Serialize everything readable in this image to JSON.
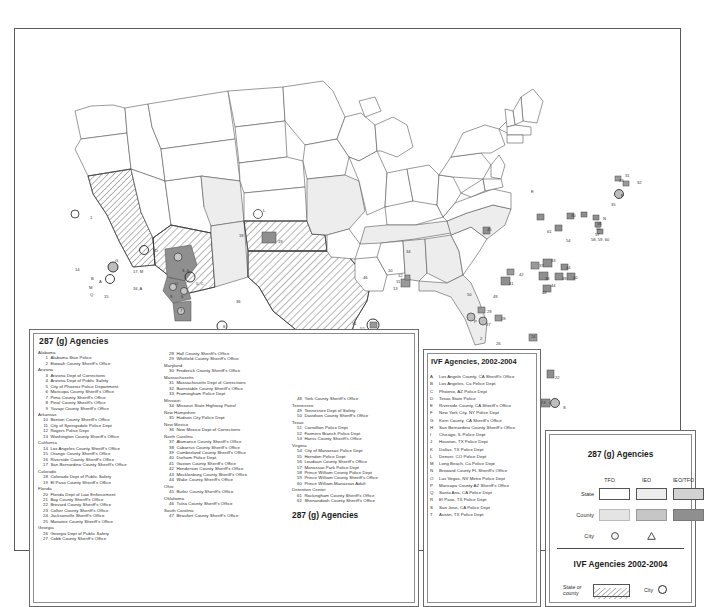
{
  "map": {
    "title": "287(g) and IVF Agencies United States Map",
    "region": "United States",
    "colors": {
      "state_tfo": "#ffffff",
      "state_ieo": "#ededed",
      "state_ieo_tfo": "#d2d2d2",
      "county_tfo": "#e4e4e4",
      "county_ieo": "#c6c6c6",
      "county_ieo_tfo": "#8f8f8f",
      "outline": "#555555",
      "hatch": "#6b6b6b"
    },
    "map_labels": [
      {
        "id": "1",
        "x": 73,
        "y": 189
      },
      {
        "id": "G",
        "x": 100,
        "y": 232
      },
      {
        "id": "17, M",
        "x": 118,
        "y": 243
      },
      {
        "id": "14",
        "x": 65,
        "y": 241
      },
      {
        "id": "B",
        "x": 76,
        "y": 250
      },
      {
        "id": "A",
        "x": 82,
        "y": 253
      },
      {
        "id": "M",
        "x": 75,
        "y": 259
      },
      {
        "id": "Q",
        "x": 76,
        "y": 266
      },
      {
        "id": "15",
        "x": 89,
        "y": 268
      },
      {
        "id": "16, A",
        "x": 118,
        "y": 260
      },
      {
        "id": "D",
        "x": 140,
        "y": 222
      },
      {
        "id": "3, 4",
        "x": 167,
        "y": 242
      },
      {
        "id": "O",
        "x": 160,
        "y": 255
      },
      {
        "id": "5, C",
        "x": 180,
        "y": 255
      },
      {
        "id": "9",
        "x": 155,
        "y": 268
      },
      {
        "id": "6",
        "x": 166,
        "y": 268
      },
      {
        "id": "7",
        "x": 165,
        "y": 282
      },
      {
        "id": "36",
        "x": 234,
        "y": 273
      },
      {
        "id": "18",
        "x": 237,
        "y": 207
      },
      {
        "id": "L",
        "x": 259,
        "y": 196
      },
      {
        "id": "19",
        "x": 268,
        "y": 213
      },
      {
        "id": "8",
        "x": 220,
        "y": 298
      },
      {
        "id": "46",
        "x": 349,
        "y": 249
      },
      {
        "id": "10",
        "x": 374,
        "y": 242
      },
      {
        "id": "12",
        "x": 383,
        "y": 247
      },
      {
        "id": "11",
        "x": 381,
        "y": 253
      },
      {
        "id": "13",
        "x": 378,
        "y": 260
      },
      {
        "id": "34",
        "x": 391,
        "y": 223
      },
      {
        "id": "51",
        "x": 338,
        "y": 295
      },
      {
        "id": "D",
        "x": 310,
        "y": 316
      },
      {
        "id": "52",
        "x": 345,
        "y": 300
      },
      {
        "id": "T",
        "x": 337,
        "y": 332
      },
      {
        "id": "53",
        "x": 366,
        "y": 341
      },
      {
        "id": "J",
        "x": 365,
        "y": 347
      },
      {
        "id": "45",
        "x": 485,
        "y": 203
      },
      {
        "id": "E",
        "x": 529,
        "y": 163
      },
      {
        "id": "N",
        "x": 596,
        "y": 190
      },
      {
        "id": "56",
        "x": 591,
        "y": 195
      },
      {
        "id": "55",
        "x": 590,
        "y": 200
      },
      {
        "id": "57",
        "x": 589,
        "y": 206
      },
      {
        "id": "58, 59, 60",
        "x": 589,
        "y": 211
      },
      {
        "id": "30",
        "x": 566,
        "y": 187
      },
      {
        "id": "61",
        "x": 541,
        "y": 203
      },
      {
        "id": "54",
        "x": 560,
        "y": 212
      },
      {
        "id": "37",
        "x": 535,
        "y": 237
      },
      {
        "id": "43",
        "x": 547,
        "y": 232
      },
      {
        "id": "44",
        "x": 562,
        "y": 239
      },
      {
        "id": "38",
        "x": 541,
        "y": 250
      },
      {
        "id": "39",
        "x": 558,
        "y": 250
      },
      {
        "id": "40",
        "x": 568,
        "y": 249
      },
      {
        "id": "42",
        "x": 516,
        "y": 246
      },
      {
        "id": "41",
        "x": 506,
        "y": 255
      },
      {
        "id": "44",
        "x": 547,
        "y": 257
      },
      {
        "id": "48",
        "x": 538,
        "y": 264
      },
      {
        "id": "29",
        "x": 484,
        "y": 283
      },
      {
        "id": "P",
        "x": 471,
        "y": 293
      },
      {
        "id": "28",
        "x": 497,
        "y": 290
      },
      {
        "id": "27",
        "x": 483,
        "y": 296
      },
      {
        "id": "26",
        "x": 493,
        "y": 315
      },
      {
        "id": "47",
        "x": 532,
        "y": 325
      },
      {
        "id": "21",
        "x": 465,
        "y": 333
      },
      {
        "id": "24",
        "x": 528,
        "y": 308
      },
      {
        "id": "20",
        "x": 524,
        "y": 344
      },
      {
        "id": "22",
        "x": 551,
        "y": 349
      },
      {
        "id": "25",
        "x": 518,
        "y": 362
      },
      {
        "id": "23",
        "x": 538,
        "y": 374
      },
      {
        "id": "S",
        "x": 556,
        "y": 377
      },
      {
        "id": "49",
        "x": 490,
        "y": 268
      },
      {
        "id": "50",
        "x": 463,
        "y": 266
      },
      {
        "id": "35",
        "x": 606,
        "y": 176
      },
      {
        "id": "F",
        "x": 613,
        "y": 167
      },
      {
        "id": "31",
        "x": 617,
        "y": 147
      },
      {
        "id": "33",
        "x": 612,
        "y": 152
      },
      {
        "id": "32",
        "x": 629,
        "y": 154
      },
      {
        "id": "2",
        "x": 476,
        "y": 310
      }
    ]
  },
  "panel_287g": {
    "title": "287 (g) Agencies",
    "footer": "287 (g) Agencies",
    "column1": [
      {
        "type": "state",
        "name": "Alabama"
      },
      {
        "type": "agency",
        "num": "1",
        "name": "Alabama Stae Police"
      },
      {
        "type": "agency",
        "num": "2",
        "name": "Etowah County Sheriff's Office"
      },
      {
        "type": "state",
        "name": "Arizona"
      },
      {
        "type": "agency",
        "num": "3",
        "name": "Arizona Dept of Corrections"
      },
      {
        "type": "agency",
        "num": "4",
        "name": "Arizona Dept of Public Safety"
      },
      {
        "type": "agency",
        "num": "5",
        "name": "City of Phoenix Police Department"
      },
      {
        "type": "agency",
        "num": "6",
        "name": "Maricopa County Sheriff's Office"
      },
      {
        "type": "agency",
        "num": "7",
        "name": "Pima County Sheriff's Office"
      },
      {
        "type": "agency",
        "num": "8",
        "name": "Pinal County Sheriff's Office"
      },
      {
        "type": "agency",
        "num": "9",
        "name": "Yavapi County Sheriff's Office"
      },
      {
        "type": "state",
        "name": "Arkansas"
      },
      {
        "type": "agency",
        "num": "10",
        "name": "Benton County Sheriff's Office"
      },
      {
        "type": "agency",
        "num": "11",
        "name": "City of Springsdale Police Dept"
      },
      {
        "type": "agency",
        "num": "12",
        "name": "Rogers Police Dept"
      },
      {
        "type": "agency",
        "num": "13",
        "name": "Washington County Sheriff's Office"
      },
      {
        "type": "state",
        "name": "California"
      },
      {
        "type": "agency",
        "num": "14",
        "name": "Los Angeles County Sheriff's Office"
      },
      {
        "type": "agency",
        "num": "15",
        "name": "Orange County Sheriff's Office"
      },
      {
        "type": "agency",
        "num": "16",
        "name": "Riverside County Sheriff's Office"
      },
      {
        "type": "agency",
        "num": "17",
        "name": "San Bernardino County Sheriff's Office"
      },
      {
        "type": "state",
        "name": "Colorado"
      },
      {
        "type": "agency",
        "num": "18",
        "name": "Colorado Dept of Public Safety"
      },
      {
        "type": "agency",
        "num": "19",
        "name": "El Paso County Sheriff's Office"
      },
      {
        "type": "state",
        "name": "Florida"
      },
      {
        "type": "agency",
        "num": "20",
        "name": "Florida Dept of Law Enforcement"
      },
      {
        "type": "agency",
        "num": "21",
        "name": "Bay County Sheriff's Office"
      },
      {
        "type": "agency",
        "num": "22",
        "name": "Brevard County Sheriff's Office"
      },
      {
        "type": "agency",
        "num": "23",
        "name": "Collier County Sheriff's Office"
      },
      {
        "type": "agency",
        "num": "24",
        "name": "Jacksonville Sheriff's Office"
      },
      {
        "type": "agency",
        "num": "25",
        "name": "Manatee County Sheriff's Office"
      },
      {
        "type": "state",
        "name": "Georgia"
      },
      {
        "type": "agency",
        "num": "26",
        "name": "Georgia Dept of Public Safety"
      },
      {
        "type": "agency",
        "num": "27",
        "name": "Cobb County Sheriff's Office"
      }
    ],
    "column2": [
      {
        "type": "agency",
        "num": "28",
        "name": "Hall County Sheriff's Office"
      },
      {
        "type": "agency",
        "num": "29",
        "name": "Whitfield County Sheriff's Office"
      },
      {
        "type": "state",
        "name": "Maryland"
      },
      {
        "type": "agency",
        "num": "30",
        "name": "Frederick County Sheriff's Office"
      },
      {
        "type": "state",
        "name": "Massachusetts"
      },
      {
        "type": "agency",
        "num": "31",
        "name": "Massachusetts Dept of Corrections"
      },
      {
        "type": "agency",
        "num": "32",
        "name": "Barnstable County Sheriff's Office"
      },
      {
        "type": "agency",
        "num": "33",
        "name": "Framingham Police Dept"
      },
      {
        "type": "state",
        "name": "Missouri"
      },
      {
        "type": "agency",
        "num": "34",
        "name": "Missouri State Highway Patrol"
      },
      {
        "type": "state",
        "name": "New Hampshire"
      },
      {
        "type": "agency",
        "num": "35",
        "name": "Hudson City Police Dept"
      },
      {
        "type": "state",
        "name": "New Mexico"
      },
      {
        "type": "agency",
        "num": "36",
        "name": "New Mexico Dept of Corrections"
      },
      {
        "type": "state",
        "name": "North Carolina"
      },
      {
        "type": "agency",
        "num": "37",
        "name": "Alamance County Sheriff's Office"
      },
      {
        "type": "agency",
        "num": "38",
        "name": "Cabarrus County Sheriff's Office"
      },
      {
        "type": "agency",
        "num": "39",
        "name": "Cumberland County Sheriff's Office"
      },
      {
        "type": "agency",
        "num": "40",
        "name": "Durham Police Dept"
      },
      {
        "type": "agency",
        "num": "41",
        "name": "Gaston County Sheriff's Office"
      },
      {
        "type": "agency",
        "num": "42",
        "name": "Henderson County Sheriff's Office"
      },
      {
        "type": "agency",
        "num": "43",
        "name": "Mecklenburg County Sheriff's Office"
      },
      {
        "type": "agency",
        "num": "44",
        "name": "Wake County Sheriff's Office"
      },
      {
        "type": "state",
        "name": "Ohio"
      },
      {
        "type": "agency",
        "num": "45",
        "name": "Butler County Sheriff's Office"
      },
      {
        "type": "state",
        "name": "Oklahoma"
      },
      {
        "type": "agency",
        "num": "46",
        "name": "Tulsa County Sheriff's Office"
      },
      {
        "type": "state",
        "name": "South Carolina"
      },
      {
        "type": "agency",
        "num": "47",
        "name": "Beaufort County Sheriff's Office"
      }
    ],
    "column3": [
      {
        "type": "agency",
        "num": "48",
        "name": "York County Sheriff's Office"
      },
      {
        "type": "state",
        "name": "Tennessee"
      },
      {
        "type": "agency",
        "num": "49",
        "name": "Tennessee Dept of Safety"
      },
      {
        "type": "agency",
        "num": "50",
        "name": "Davidson County Sheriff's Office"
      },
      {
        "type": "state",
        "name": "Texas"
      },
      {
        "type": "agency",
        "num": "51",
        "name": "Carrollton Police Dept"
      },
      {
        "type": "agency",
        "num": "52",
        "name": "Farmers Branch Police Dept"
      },
      {
        "type": "agency",
        "num": "53",
        "name": "Harris County Sheriff's Office"
      },
      {
        "type": "state",
        "name": "Virginia"
      },
      {
        "type": "agency",
        "num": "54",
        "name": "City of Manassas Police Dept"
      },
      {
        "type": "agency",
        "num": "55",
        "name": "Herndon Police Dept"
      },
      {
        "type": "agency",
        "num": "56",
        "name": "Loudoun County Sheriff's Office"
      },
      {
        "type": "agency",
        "num": "57",
        "name": "Manassas Park Police Dept"
      },
      {
        "type": "agency",
        "num": "58",
        "name": "Prince William County Police Dept"
      },
      {
        "type": "agency",
        "num": "59",
        "name": "Prince William County Sheriff's Office"
      },
      {
        "type": "agency",
        "num": "60",
        "name": "Prince William-Manassas Adult"
      },
      {
        "type": "state",
        "name": "Detention Center"
      },
      {
        "type": "agency",
        "num": "61",
        "name": "Rockingham County Sheriff's Office"
      },
      {
        "type": "agency",
        "num": "62",
        "name": "Shenandoah County Sheriff's Office"
      }
    ]
  },
  "panel_ivf": {
    "title": "IVF Agencies, 2002-2004",
    "rows": [
      {
        "letter": "A",
        "name": "Los Angele County, CA Sheriff's Office"
      },
      {
        "letter": "B",
        "name": "Los Angeles, Ca Police Dept"
      },
      {
        "letter": "C",
        "name": "Phoenix, AZ Police Dept"
      },
      {
        "letter": "D",
        "name": "Texas State Police"
      },
      {
        "letter": "E",
        "name": "Riverside County, CA Sheriff's Office"
      },
      {
        "letter": "F",
        "name": "New York City, NY Police Dept"
      },
      {
        "letter": "G",
        "name": "Kern County, CA Sheriff's Office"
      },
      {
        "letter": "H",
        "name": "San Bernardino County Sheriff's Office"
      },
      {
        "letter": "I",
        "name": "Chicago, IL Police Dept"
      },
      {
        "letter": "J",
        "name": "Houston, TX Police Dept"
      },
      {
        "letter": "K",
        "name": "Dallas, TX Police Dept"
      },
      {
        "letter": "L",
        "name": "Denver, CO Police Dept"
      },
      {
        "letter": "M",
        "name": "Long Beach, Ca Police Dept"
      },
      {
        "letter": "N",
        "name": "Broward County FL Sheriff's Office"
      },
      {
        "letter": "O",
        "name": "Las Vegas, NV Metro Police Dept"
      },
      {
        "letter": "P",
        "name": "Maricopa County AZ Sheriff's Office"
      },
      {
        "letter": "Q",
        "name": "Santa Ana, CA Police Dept"
      },
      {
        "letter": "R",
        "name": "El Paso, TX Police Dept"
      },
      {
        "letter": "S",
        "name": "San Jose, CA Police Dept"
      },
      {
        "letter": "T",
        "name": "Austin, TX Police Dept"
      }
    ]
  },
  "panel_symbols": {
    "title_287g": "287 (g) Agencies",
    "col_headers": [
      "TFO",
      "IEO",
      "IEO/TFO"
    ],
    "rows": [
      {
        "label": "State"
      },
      {
        "label": "County"
      },
      {
        "label": "City"
      }
    ],
    "city_symbols": [
      "circle",
      "triangle"
    ],
    "title_ivf": "IVF Agencies 2002-2004",
    "ivf_state_label": "State or county",
    "ivf_city_label": "City",
    "ivf_city_symbol": "circle"
  }
}
